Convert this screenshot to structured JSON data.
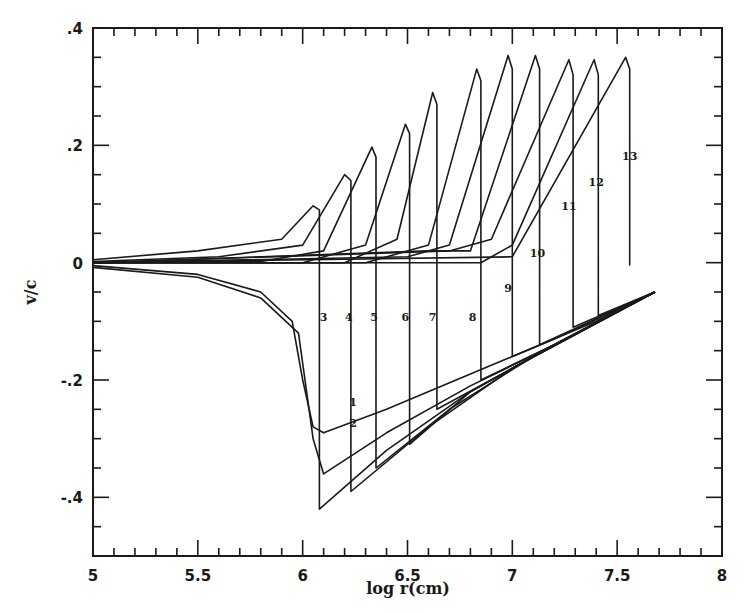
{
  "chart_data": {
    "type": "line",
    "title": "",
    "xlabel": "log r(cm)",
    "ylabel": "v/c",
    "xlim": [
      5,
      8
    ],
    "ylim": [
      -0.5,
      0.4
    ],
    "grid": false,
    "legend_position": "none (curves labeled inline 1-13)",
    "x_ticks": [
      "5",
      "5.5",
      "6",
      "6.5",
      "7",
      "7.5",
      "8"
    ],
    "y_ticks": [
      ".4",
      ".2",
      "0",
      "-.2",
      "-.4"
    ],
    "series": [
      {
        "name": "1",
        "points": [
          [
            5.0,
            -0.005
          ],
          [
            5.5,
            -0.02
          ],
          [
            5.8,
            -0.05
          ],
          [
            5.95,
            -0.1
          ],
          [
            6.0,
            -0.2
          ],
          [
            6.05,
            -0.28
          ],
          [
            6.1,
            -0.29
          ],
          [
            6.4,
            -0.25
          ],
          [
            6.8,
            -0.19
          ],
          [
            7.2,
            -0.13
          ],
          [
            7.68,
            -0.05
          ]
        ]
      },
      {
        "name": "2",
        "points": [
          [
            5.0,
            -0.008
          ],
          [
            5.5,
            -0.025
          ],
          [
            5.8,
            -0.06
          ],
          [
            5.98,
            -0.12
          ],
          [
            6.05,
            -0.3
          ],
          [
            6.1,
            -0.36
          ],
          [
            6.4,
            -0.29
          ],
          [
            6.8,
            -0.21
          ],
          [
            7.2,
            -0.14
          ],
          [
            7.68,
            -0.05
          ]
        ]
      },
      {
        "name": "3",
        "points": [
          [
            5.0,
            0.005
          ],
          [
            5.5,
            0.02
          ],
          [
            5.9,
            0.04
          ],
          [
            6.05,
            0.097
          ],
          [
            6.08,
            0.09
          ],
          [
            6.08,
            -0.42
          ],
          [
            6.4,
            -0.32
          ],
          [
            6.8,
            -0.22
          ],
          [
            7.2,
            -0.14
          ],
          [
            7.68,
            -0.05
          ]
        ]
      },
      {
        "name": "4",
        "points": [
          [
            5.0,
            0.002
          ],
          [
            5.6,
            0.01
          ],
          [
            6.0,
            0.03
          ],
          [
            6.2,
            0.15
          ],
          [
            6.23,
            0.14
          ],
          [
            6.23,
            -0.39
          ],
          [
            6.6,
            -0.28
          ],
          [
            7.0,
            -0.18
          ],
          [
            7.68,
            -0.05
          ]
        ]
      },
      {
        "name": "5",
        "points": [
          [
            5.0,
            0.0
          ],
          [
            5.8,
            0.002
          ],
          [
            6.1,
            0.02
          ],
          [
            6.33,
            0.197
          ],
          [
            6.35,
            0.18
          ],
          [
            6.35,
            -0.35
          ],
          [
            6.7,
            -0.25
          ],
          [
            7.1,
            -0.16
          ],
          [
            7.68,
            -0.05
          ]
        ]
      },
      {
        "name": "6",
        "points": [
          [
            5.0,
            0.0
          ],
          [
            6.0,
            0.0
          ],
          [
            6.3,
            0.03
          ],
          [
            6.49,
            0.236
          ],
          [
            6.51,
            0.22
          ],
          [
            6.51,
            -0.31
          ],
          [
            6.8,
            -0.22
          ],
          [
            7.2,
            -0.14
          ],
          [
            7.68,
            -0.05
          ]
        ]
      },
      {
        "name": "7",
        "points": [
          [
            5.0,
            0.0
          ],
          [
            6.2,
            0.0
          ],
          [
            6.45,
            0.04
          ],
          [
            6.62,
            0.29
          ],
          [
            6.64,
            0.27
          ],
          [
            6.64,
            -0.25
          ],
          [
            7.0,
            -0.18
          ],
          [
            7.68,
            -0.05
          ]
        ]
      },
      {
        "name": "8",
        "points": [
          [
            5.0,
            0.0
          ],
          [
            6.3,
            0.0
          ],
          [
            6.6,
            0.03
          ],
          [
            6.83,
            0.33
          ],
          [
            6.85,
            0.31
          ],
          [
            6.85,
            -0.2
          ],
          [
            7.2,
            -0.14
          ],
          [
            7.68,
            -0.05
          ]
        ]
      },
      {
        "name": "9",
        "points": [
          [
            5.0,
            0.0
          ],
          [
            6.5,
            0.01
          ],
          [
            6.7,
            0.03
          ],
          [
            6.98,
            0.353
          ],
          [
            7.0,
            0.33
          ],
          [
            7.0,
            -0.16
          ],
          [
            7.4,
            -0.1
          ],
          [
            7.68,
            -0.05
          ]
        ]
      },
      {
        "name": "10",
        "points": [
          [
            5.0,
            0.0
          ],
          [
            6.6,
            0.02
          ],
          [
            6.8,
            0.02
          ],
          [
            7.11,
            0.353
          ],
          [
            7.13,
            0.33
          ],
          [
            7.13,
            -0.14
          ],
          [
            7.68,
            -0.05
          ]
        ]
      },
      {
        "name": "11",
        "points": [
          [
            5.0,
            0.0
          ],
          [
            6.7,
            0.02
          ],
          [
            6.9,
            0.04
          ],
          [
            7.27,
            0.346
          ],
          [
            7.29,
            0.32
          ],
          [
            7.29,
            -0.11
          ],
          [
            7.68,
            -0.05
          ]
        ]
      },
      {
        "name": "12",
        "points": [
          [
            5.0,
            0.0
          ],
          [
            6.85,
            0.0
          ],
          [
            7.0,
            0.03
          ],
          [
            7.39,
            0.346
          ],
          [
            7.41,
            0.32
          ],
          [
            7.41,
            -0.09
          ],
          [
            7.68,
            -0.05
          ]
        ]
      },
      {
        "name": "13",
        "points": [
          [
            5.0,
            0.0
          ],
          [
            7.0,
            0.01
          ],
          [
            7.54,
            0.35
          ],
          [
            7.56,
            0.33
          ],
          [
            7.56,
            -0.005
          ]
        ]
      }
    ],
    "annotations": [
      {
        "text": "1",
        "x": 6.24,
        "y": -0.245
      },
      {
        "text": "2",
        "x": 6.24,
        "y": -0.28
      },
      {
        "text": "3",
        "x": 6.1,
        "y": -0.1
      },
      {
        "text": "4",
        "x": 6.22,
        "y": -0.1
      },
      {
        "text": "5",
        "x": 6.34,
        "y": -0.1
      },
      {
        "text": "6",
        "x": 6.49,
        "y": -0.1
      },
      {
        "text": "7",
        "x": 6.62,
        "y": -0.1
      },
      {
        "text": "8",
        "x": 6.81,
        "y": -0.1
      },
      {
        "text": "9",
        "x": 6.98,
        "y": -0.05
      },
      {
        "text": "10",
        "x": 7.12,
        "y": 0.01
      },
      {
        "text": "11",
        "x": 7.27,
        "y": 0.09
      },
      {
        "text": "12",
        "x": 7.4,
        "y": 0.13
      },
      {
        "text": "13",
        "x": 7.56,
        "y": 0.175
      }
    ]
  },
  "axes": {
    "x_title": "log r(cm)",
    "y_title": "v/c"
  }
}
